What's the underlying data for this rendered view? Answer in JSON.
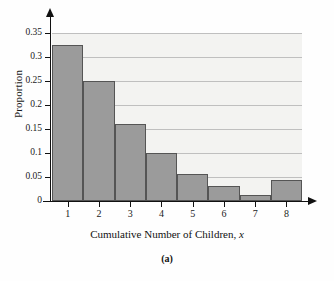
{
  "chart_data": {
    "type": "bar",
    "title": "",
    "subtitle": "",
    "caption": "(a)",
    "xlabel_text": "Cumulative Number of Children, ",
    "xlabel_variable": "x",
    "ylabel": "Proportion",
    "categories": [
      "1",
      "2",
      "3",
      "4",
      "5",
      "6",
      "7",
      "8"
    ],
    "values": [
      0.325,
      0.251,
      0.16,
      0.1,
      0.056,
      0.031,
      0.012,
      0.043
    ],
    "series": [
      {
        "name": "Proportion",
        "values": [
          0.325,
          0.251,
          0.16,
          0.1,
          0.056,
          0.031,
          0.012,
          0.043
        ]
      }
    ],
    "xlim": [
      0.5,
      8.5
    ],
    "ylim": [
      0,
      0.35
    ],
    "yticks": [
      0,
      0.05,
      0.1,
      0.15,
      0.2,
      0.25,
      0.3,
      0.35
    ],
    "ytick_labels": [
      "0",
      "0.05",
      "0.1",
      "0.15",
      "0.2",
      "0.25",
      "0.3",
      "0.35"
    ],
    "xticks": [
      1,
      2,
      3,
      4,
      5,
      6,
      7,
      8
    ],
    "xtick_labels": [
      "1",
      "2",
      "3",
      "4",
      "5",
      "6",
      "7",
      "8"
    ],
    "grid": true,
    "grid_axis": "y",
    "legend": false,
    "legend_position": "none",
    "bar_fill_color": "#9b9b9b",
    "bar_edge_color": "#555555",
    "plot_background_color": "#f3f3f1",
    "gridline_color": "#bfbfbf",
    "axis_color": "#111111",
    "figure_background_color": "#fefefe"
  }
}
